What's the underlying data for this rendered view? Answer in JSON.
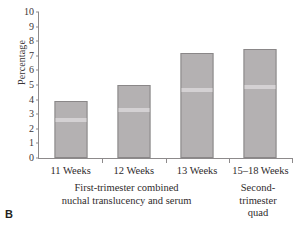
{
  "panel": {
    "letter": "B"
  },
  "chart_data": {
    "type": "bar",
    "title": "",
    "xlabel": "",
    "ylabel": "Percentage",
    "categories": [
      "11 Weeks",
      "12 Weeks",
      "13 Weeks",
      "15–18 Weeks"
    ],
    "values": [
      3.9,
      5.0,
      7.2,
      7.5
    ],
    "ylim": [
      0,
      10
    ],
    "yticks": [
      0,
      1,
      2,
      3,
      4,
      5,
      6,
      7,
      8,
      9,
      10
    ],
    "ytick_labels": [
      "0",
      "1",
      "2",
      "3",
      "4",
      "5",
      "6",
      "7",
      "8",
      "9",
      "10"
    ],
    "grid": false,
    "legend": "none",
    "bar_color": "#b4b1b2",
    "bar_edge_color": "#8a8788",
    "axis_color": "#8d8a8b",
    "group_captions": [
      {
        "lines": [
          "First-trimester combined",
          "nuchal translucency and serum"
        ],
        "categories": [
          "11 Weeks",
          "12 Weeks",
          "13 Weeks"
        ]
      },
      {
        "lines": [
          "Second-",
          "trimester",
          "quad"
        ],
        "categories": [
          "15–18 Weeks"
        ]
      }
    ]
  }
}
